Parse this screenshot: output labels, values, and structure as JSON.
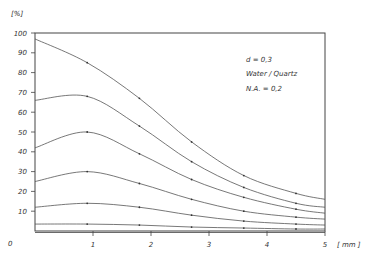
{
  "chart_data": {
    "type": "line",
    "title": "",
    "xlabel": "[ mm ]",
    "ylabel": "[%]",
    "xlim": [
      0,
      5
    ],
    "ylim": [
      0,
      100
    ],
    "x_ticks": [
      "0",
      "1",
      "2",
      "3",
      "4",
      "5"
    ],
    "y_ticks": [
      "10",
      "20",
      "30",
      "40",
      "50",
      "60",
      "70",
      "80",
      "90",
      "100"
    ],
    "grid": false,
    "annotations": [
      "d = 0,3",
      "Water / Quartz",
      "N.A. = 0,2"
    ],
    "x": [
      0,
      0.9,
      1.8,
      2.7,
      3.6,
      4.5,
      5
    ],
    "series": [
      {
        "name": "curve-1",
        "values": [
          97,
          85,
          67,
          45,
          28,
          19,
          16
        ]
      },
      {
        "name": "curve-2",
        "values": [
          66,
          68,
          53,
          35,
          22,
          14,
          12
        ]
      },
      {
        "name": "curve-3",
        "values": [
          42,
          50,
          39,
          26,
          17,
          11,
          9
        ]
      },
      {
        "name": "curve-4",
        "values": [
          25,
          30,
          24,
          16,
          10,
          7,
          6
        ]
      },
      {
        "name": "curve-5",
        "values": [
          12,
          14,
          12,
          8,
          5,
          3.5,
          3
        ]
      },
      {
        "name": "curve-6",
        "values": [
          3.5,
          3.5,
          3,
          2,
          1.5,
          1,
          1
        ]
      }
    ]
  }
}
